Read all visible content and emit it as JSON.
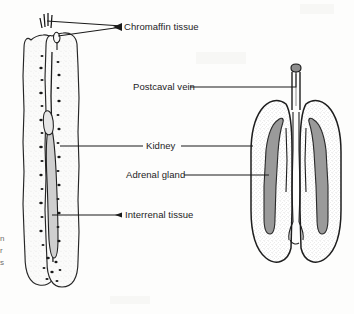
{
  "figure": {
    "background_color": "#fdfdfc",
    "ink_color": "#1c1c1c",
    "gray_fill_color": "#9a9a9a",
    "stipple_color": "#cfcfcf"
  },
  "labels": {
    "chromaffin": "Chromaffin tissue",
    "postcaval": "Postcaval vein",
    "kidney": "Kidney",
    "adrenal": "Adrenal gland",
    "interrenal": "Interrenal tissue"
  },
  "edge_fragment": {
    "line1": "n",
    "line2": "r",
    "line3": "s"
  },
  "structures": {
    "left_specimen": "paired elongate kidneys with speckled chromaffin and interrenal tissue",
    "right_specimen": "paired kidneys in section with gray adrenal bands and postcaval vein"
  }
}
